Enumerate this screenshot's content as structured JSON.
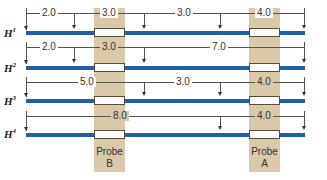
{
  "colors": {
    "dna": "#1f5fa8",
    "band": "#d9c9a8",
    "probe_box": "#ffffff"
  },
  "probes": [
    {
      "name": "Probe B",
      "line1": "Probe",
      "line2": "B"
    },
    {
      "name": "Probe A",
      "line1": "Probe",
      "line2": "A"
    }
  ],
  "rows": [
    {
      "label": "H",
      "sup": "1",
      "segments": [
        "2.0",
        "3.0",
        "3.0",
        "4.0"
      ]
    },
    {
      "label": "H",
      "sup": "2",
      "segments": [
        "2.0",
        "3.0",
        "7.0"
      ]
    },
    {
      "label": "H",
      "sup": "3",
      "segments": [
        "5.0",
        "3.0",
        "4.0"
      ]
    },
    {
      "label": "H",
      "sup": "4",
      "segments": [
        "8.0",
        "4.0"
      ]
    }
  ]
}
